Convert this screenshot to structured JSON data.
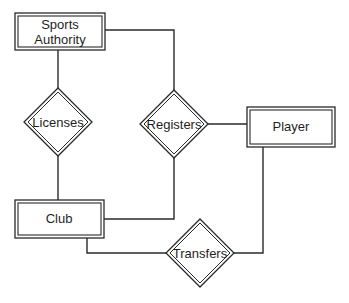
{
  "diagram": {
    "type": "er-diagram",
    "entities": [
      {
        "id": "sports-authority",
        "lines": [
          "Sports",
          "Authority"
        ],
        "weak": true
      },
      {
        "id": "player",
        "lines": [
          "Player"
        ],
        "weak": true
      },
      {
        "id": "club",
        "lines": [
          "Club"
        ],
        "weak": true
      }
    ],
    "relationships": [
      {
        "id": "licenses",
        "label": "Licenses",
        "identifying": true
      },
      {
        "id": "registers",
        "label": "Registers",
        "identifying": true
      },
      {
        "id": "transfers",
        "label": "Transfers",
        "identifying": true
      }
    ],
    "edges": [
      {
        "from": "sports-authority",
        "to": "licenses"
      },
      {
        "from": "licenses",
        "to": "club"
      },
      {
        "from": "sports-authority",
        "to": "registers"
      },
      {
        "from": "registers",
        "to": "player"
      },
      {
        "from": "club",
        "to": "registers"
      },
      {
        "from": "club",
        "to": "transfers"
      },
      {
        "from": "transfers",
        "to": "player"
      }
    ],
    "colors": {
      "stroke": "#2a2a2a",
      "background": "#ffffff",
      "text": "#1e1e1e"
    }
  }
}
